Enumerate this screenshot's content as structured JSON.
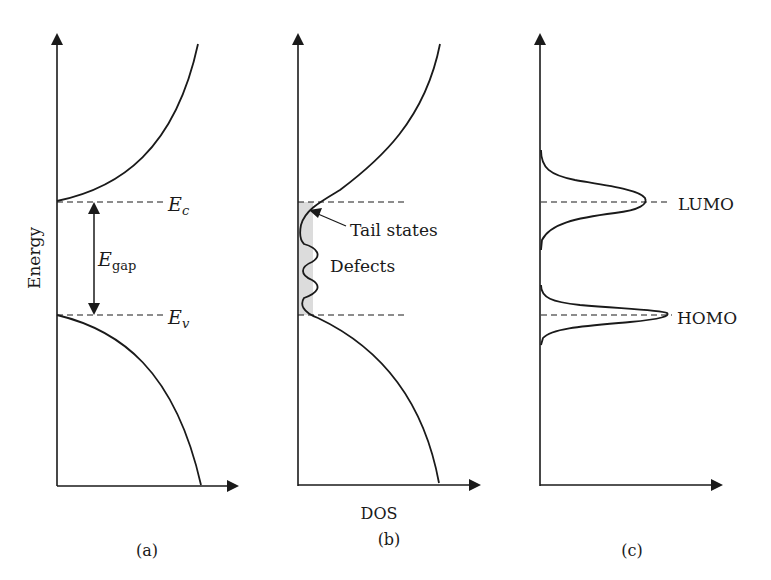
{
  "figure": {
    "y_axis_label": "Energy",
    "x_axis_label": "DOS",
    "colors": {
      "line": "#1a1a1a",
      "shade": "#d9d9d9",
      "background": "#ffffff"
    }
  },
  "panels": [
    {
      "id": "a",
      "caption": "(a)",
      "levels": {
        "conduction": "E",
        "conduction_sub": "c",
        "valence": "E",
        "valence_sub": "v"
      },
      "gap_label": "E",
      "gap_sub": "gap"
    },
    {
      "id": "b",
      "caption": "(b)",
      "annotations": {
        "tail": "Tail states",
        "defects": "Defects"
      }
    },
    {
      "id": "c",
      "caption": "(c)",
      "levels": {
        "upper": "LUMO",
        "lower": "HOMO"
      }
    }
  ]
}
